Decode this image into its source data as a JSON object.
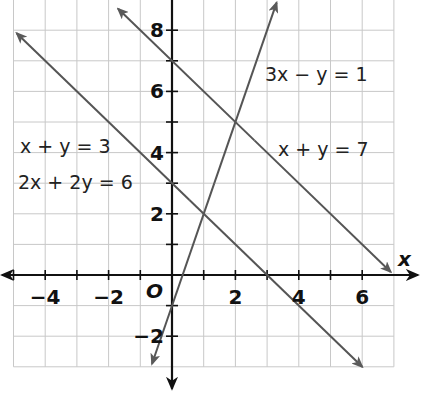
{
  "chart_data": {
    "type": "line",
    "title": "",
    "xlabel": "x",
    "ylabel": "",
    "origin_label": "O",
    "xlim": [
      -5,
      7
    ],
    "ylim": [
      -3,
      9
    ],
    "grid": true,
    "x_ticks": [
      -4,
      -2,
      2,
      4,
      6
    ],
    "y_ticks": [
      -2,
      2,
      4,
      6,
      8
    ],
    "x_tick_labels": [
      "−4",
      "−2",
      "2",
      "4",
      "6"
    ],
    "y_tick_labels": [
      "−2",
      "2",
      "4",
      "6",
      "8"
    ],
    "series": [
      {
        "name": "x + y = 7",
        "equation": "x + y = 7",
        "points": [
          [
            -1.7,
            8.7
          ],
          [
            0,
            7
          ],
          [
            2,
            5
          ],
          [
            6.9,
            0.1
          ]
        ]
      },
      {
        "name": "x + y = 3 / 2x + 2y = 6",
        "equation": "x + y = 3",
        "equivalent": "2x + 2y = 6",
        "points": [
          [
            -4.9,
            7.9
          ],
          [
            0,
            3
          ],
          [
            3,
            0
          ],
          [
            6,
            -3
          ]
        ]
      },
      {
        "name": "3x − y = 1",
        "equation": "3x − y = 1",
        "points": [
          [
            -0.63,
            -2.9
          ],
          [
            0,
            -1
          ],
          [
            1,
            2
          ],
          [
            2,
            5
          ],
          [
            3.3,
            8.9
          ]
        ]
      }
    ],
    "annotations": [
      {
        "text": "3x − y = 1",
        "x": 3.0,
        "y": 6.3
      },
      {
        "text": "x + y = 7",
        "x": 3.4,
        "y": 3.8
      },
      {
        "text": "x + y = 3",
        "x": -4.8,
        "y": 4.0
      },
      {
        "text": "2x + 2y = 6",
        "x": -4.8,
        "y": 2.9
      }
    ],
    "intersections": [
      {
        "lines": [
          "3x − y = 1",
          "x + y = 7"
        ],
        "point": [
          2,
          5
        ]
      },
      {
        "lines": [
          "3x − y = 1",
          "x + y = 3"
        ],
        "point": [
          1,
          2
        ]
      }
    ]
  },
  "labels": {
    "x_axis": "x",
    "origin": "O",
    "eq1": "3x − y = 1",
    "eq2": "x + y = 7",
    "eq3": "x + y = 3",
    "eq4": "2x + 2y = 6"
  },
  "colors": {
    "grid": "#c8c8c8",
    "axis": "#111111",
    "lines": "#555555"
  }
}
